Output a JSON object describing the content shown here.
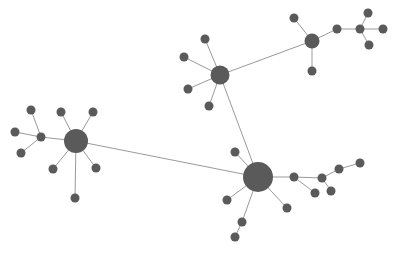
{
  "diagram": {
    "type": "network-graph",
    "colors": {
      "node": "#5a5a5a",
      "edge": "#9a9a9a",
      "background": "#ffffff"
    },
    "nodes": [
      {
        "id": "h1",
        "x": 76,
        "y": 141,
        "r": 12
      },
      {
        "id": "a1",
        "x": 41,
        "y": 137,
        "r": 4.5
      },
      {
        "id": "a2",
        "x": 31,
        "y": 110,
        "r": 4.5
      },
      {
        "id": "a3",
        "x": 15,
        "y": 132,
        "r": 4.5
      },
      {
        "id": "a4",
        "x": 21,
        "y": 153,
        "r": 4.5
      },
      {
        "id": "a5",
        "x": 61,
        "y": 112,
        "r": 4.5
      },
      {
        "id": "a6",
        "x": 93,
        "y": 112,
        "r": 4.5
      },
      {
        "id": "a7",
        "x": 53,
        "y": 169,
        "r": 4.5
      },
      {
        "id": "a8",
        "x": 96,
        "y": 168,
        "r": 4.5
      },
      {
        "id": "a9",
        "x": 75,
        "y": 198,
        "r": 4.5
      },
      {
        "id": "h2",
        "x": 220,
        "y": 75,
        "r": 9.5
      },
      {
        "id": "b1",
        "x": 205,
        "y": 39,
        "r": 4.5
      },
      {
        "id": "b2",
        "x": 184,
        "y": 57,
        "r": 4.5
      },
      {
        "id": "b3",
        "x": 188,
        "y": 89,
        "r": 4.5
      },
      {
        "id": "b4",
        "x": 209,
        "y": 106,
        "r": 4.5
      },
      {
        "id": "h3",
        "x": 312,
        "y": 41,
        "r": 7.5
      },
      {
        "id": "c1",
        "x": 294,
        "y": 18,
        "r": 4.5
      },
      {
        "id": "c2",
        "x": 312,
        "y": 71,
        "r": 4.5
      },
      {
        "id": "c3",
        "x": 337,
        "y": 29,
        "r": 4.5
      },
      {
        "id": "c4",
        "x": 360,
        "y": 29,
        "r": 4.5
      },
      {
        "id": "c5",
        "x": 368,
        "y": 13,
        "r": 4.5
      },
      {
        "id": "c6",
        "x": 383,
        "y": 29,
        "r": 4.5
      },
      {
        "id": "c7",
        "x": 369,
        "y": 45,
        "r": 4.5
      },
      {
        "id": "h4",
        "x": 258,
        "y": 177,
        "r": 15
      },
      {
        "id": "d1",
        "x": 235,
        "y": 152,
        "r": 4.5
      },
      {
        "id": "d2",
        "x": 227,
        "y": 200,
        "r": 4.5
      },
      {
        "id": "d3",
        "x": 287,
        "y": 208,
        "r": 4.5
      },
      {
        "id": "d4",
        "x": 242,
        "y": 222,
        "r": 4.5
      },
      {
        "id": "d5",
        "x": 235,
        "y": 237,
        "r": 4.5
      },
      {
        "id": "d6",
        "x": 294,
        "y": 177,
        "r": 4.5
      },
      {
        "id": "d7",
        "x": 315,
        "y": 193,
        "r": 4.5
      },
      {
        "id": "d8",
        "x": 322,
        "y": 178,
        "r": 4.5
      },
      {
        "id": "d9",
        "x": 331,
        "y": 191,
        "r": 4.5
      },
      {
        "id": "d10",
        "x": 339,
        "y": 169,
        "r": 4.5
      },
      {
        "id": "d11",
        "x": 360,
        "y": 163,
        "r": 4.5
      }
    ],
    "edges": [
      [
        "h1",
        "a1"
      ],
      [
        "a1",
        "a2"
      ],
      [
        "a1",
        "a3"
      ],
      [
        "a1",
        "a4"
      ],
      [
        "h1",
        "a5"
      ],
      [
        "h1",
        "a6"
      ],
      [
        "h1",
        "a7"
      ],
      [
        "h1",
        "a8"
      ],
      [
        "h1",
        "a9"
      ],
      [
        "h1",
        "h4"
      ],
      [
        "h2",
        "b1"
      ],
      [
        "h2",
        "b2"
      ],
      [
        "h2",
        "b3"
      ],
      [
        "h2",
        "b4"
      ],
      [
        "h2",
        "h3"
      ],
      [
        "h2",
        "h4"
      ],
      [
        "h3",
        "c1"
      ],
      [
        "h3",
        "c2"
      ],
      [
        "h3",
        "c3"
      ],
      [
        "c3",
        "c4"
      ],
      [
        "c4",
        "c5"
      ],
      [
        "c4",
        "c6"
      ],
      [
        "c4",
        "c7"
      ],
      [
        "h4",
        "d1"
      ],
      [
        "h4",
        "d2"
      ],
      [
        "h4",
        "d3"
      ],
      [
        "h4",
        "d4"
      ],
      [
        "d4",
        "d5"
      ],
      [
        "h4",
        "d6"
      ],
      [
        "d6",
        "d7"
      ],
      [
        "d6",
        "d8"
      ],
      [
        "d8",
        "d9"
      ],
      [
        "d8",
        "d10"
      ],
      [
        "d10",
        "d11"
      ]
    ]
  }
}
